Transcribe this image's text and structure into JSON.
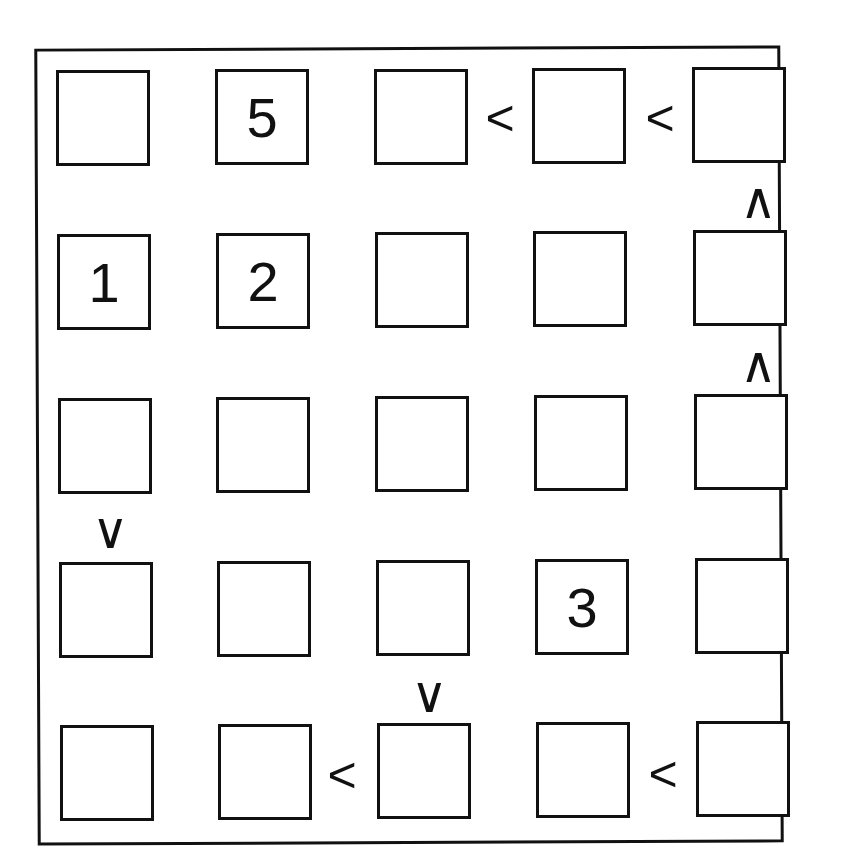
{
  "puzzle": {
    "type": "futoshiki",
    "size": 5,
    "grid": [
      [
        "",
        "5",
        "",
        "",
        ""
      ],
      [
        "1",
        "2",
        "",
        "",
        ""
      ],
      [
        "",
        "",
        "",
        "",
        ""
      ],
      [
        "",
        "",
        "",
        "3",
        ""
      ],
      [
        "",
        "",
        "",
        "",
        ""
      ]
    ],
    "horizontal_constraints": [
      {
        "row": 0,
        "between_cols": [
          2,
          3
        ],
        "symbol": "<"
      },
      {
        "row": 0,
        "between_cols": [
          3,
          4
        ],
        "symbol": "<"
      },
      {
        "row": 4,
        "between_cols": [
          1,
          2
        ],
        "symbol": "<"
      },
      {
        "row": 4,
        "between_cols": [
          3,
          4
        ],
        "symbol": "<"
      }
    ],
    "vertical_constraints": [
      {
        "col": 4,
        "between_rows": [
          0,
          1
        ],
        "symbol": "∧"
      },
      {
        "col": 4,
        "between_rows": [
          1,
          2
        ],
        "symbol": "∧"
      },
      {
        "col": 0,
        "between_rows": [
          2,
          3
        ],
        "symbol": "∨"
      },
      {
        "col": 2,
        "between_rows": [
          3,
          4
        ],
        "symbol": "∨"
      }
    ]
  },
  "colors": {
    "line": "#111111",
    "background": "#ffffff"
  }
}
